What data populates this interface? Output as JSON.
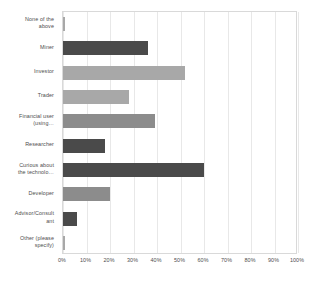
{
  "chart_data": {
    "type": "bar",
    "orientation": "horizontal",
    "title": "",
    "subtitle": "",
    "xlabel": "",
    "ylabel": "",
    "xlim": [
      0,
      100
    ],
    "xtick_labels": [
      "0%",
      "10%",
      "20%",
      "30%",
      "40%",
      "50%",
      "60%",
      "70%",
      "80%",
      "90%",
      "100%"
    ],
    "xtick_values": [
      0,
      10,
      20,
      30,
      40,
      50,
      60,
      70,
      80,
      90,
      100
    ],
    "grid": "vertical",
    "legend": "none",
    "categories": [
      "None of the above",
      "Miner",
      "Investor",
      "Trader",
      "Financial user (using…",
      "Researcher",
      "Curious about the technolo…",
      "Developer",
      "Advisor/Consultant",
      "Other (please specify)"
    ],
    "category_lines": [
      [
        "None of the",
        "above"
      ],
      [
        "Miner"
      ],
      [
        "Investor"
      ],
      [
        "Trader"
      ],
      [
        "Financial user",
        "(using…"
      ],
      [
        "Researcher"
      ],
      [
        "Curious about",
        "the technolo…"
      ],
      [
        "Developer"
      ],
      [
        "Advisor/Consult",
        "ant"
      ],
      [
        "Other (please",
        "specify)"
      ]
    ],
    "values": [
      1,
      36,
      52,
      28,
      39,
      18,
      60,
      20,
      6,
      1
    ],
    "bar_colors": [
      "#a8a8a8",
      "#4a4a4a",
      "#a8a8a8",
      "#a8a8a8",
      "#8c8c8c",
      "#4a4a4a",
      "#4a4a4a",
      "#8c8c8c",
      "#4a4a4a",
      "#a8a8a8"
    ]
  },
  "style": {
    "background": "#ffffff",
    "grid_color": "#e8e8e8",
    "frame_color": "#d9d9d9",
    "tick_label_color": "#4d4d4d"
  }
}
